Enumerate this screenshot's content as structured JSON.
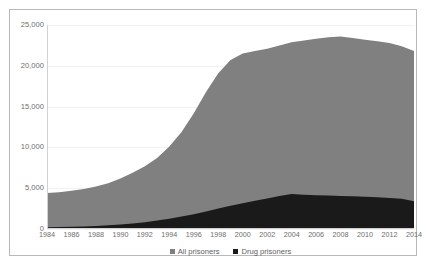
{
  "chart_data": {
    "type": "area",
    "title": "",
    "subtitle": "",
    "xlabel": "",
    "ylabel": "",
    "stacked": false,
    "grid": true,
    "legend_position": "bottom",
    "xlim": [
      1984,
      2014
    ],
    "ylim": [
      0,
      25000
    ],
    "y_ticks": [
      "0",
      "5,000",
      "10,000",
      "15,000",
      "20,000",
      "25,000"
    ],
    "y_tick_values": [
      0,
      5000,
      10000,
      15000,
      20000,
      25000
    ],
    "x_ticks": [
      "1984",
      "1986",
      "1988",
      "1990",
      "1992",
      "1994",
      "1996",
      "1998",
      "2000",
      "2002",
      "2004",
      "2006",
      "2008",
      "2010",
      "2012",
      "2014"
    ],
    "x": [
      1984,
      1985,
      1986,
      1987,
      1988,
      1989,
      1990,
      1991,
      1992,
      1993,
      1994,
      1995,
      1996,
      1997,
      1998,
      1999,
      2000,
      2001,
      2002,
      2003,
      2004,
      2005,
      2006,
      2007,
      2008,
      2009,
      2010,
      2011,
      2012,
      2013,
      2014
    ],
    "series": [
      {
        "name": "All prisoners",
        "color": "#808080",
        "values": [
          4400,
          4500,
          4700,
          4900,
          5200,
          5600,
          6200,
          6900,
          7700,
          8700,
          10100,
          11900,
          14200,
          16800,
          19100,
          20700,
          21500,
          21800,
          22100,
          22500,
          22900,
          23100,
          23300,
          23500,
          23600,
          23400,
          23200,
          23000,
          22800,
          22400,
          21800
        ]
      },
      {
        "name": "Drug prisoners",
        "color": "#1a1a1a",
        "values": [
          200,
          230,
          270,
          320,
          380,
          450,
          550,
          680,
          840,
          1030,
          1260,
          1520,
          1820,
          2150,
          2500,
          2850,
          3150,
          3450,
          3750,
          4050,
          4300,
          4200,
          4150,
          4100,
          4050,
          4000,
          3950,
          3900,
          3800,
          3700,
          3400
        ]
      }
    ],
    "legend": [
      {
        "label": "All prisoners",
        "color": "#808080",
        "marker": "square"
      },
      {
        "label": "Drug prisoners",
        "color": "#1a1a1a",
        "marker": "square"
      }
    ],
    "colors": {
      "all_prisoners": "#808080",
      "drug_prisoners": "#1a1a1a",
      "gridline": "#f1f1f1",
      "axis": "#d2d2d2",
      "tick_text": "#6d6d6d",
      "frame_border": "#b9b9b9",
      "plot_background": "#ffffff"
    }
  }
}
